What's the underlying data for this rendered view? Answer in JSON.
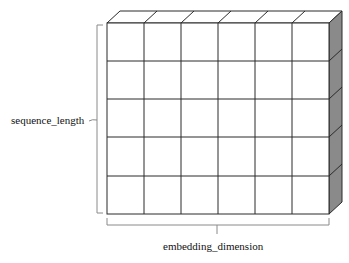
{
  "diagram": {
    "type": "3d-tensor-grid",
    "rows": 5,
    "cols": 6,
    "labels": {
      "vertical": "sequence_length",
      "horizontal": "embedding_dimension"
    },
    "colors": {
      "front_face": "#ffffff",
      "top_face": "#ffffff",
      "side_face": "#8a8a8a",
      "grid_line": "#2a2a2a",
      "bracket": "#8a8a8a"
    }
  }
}
